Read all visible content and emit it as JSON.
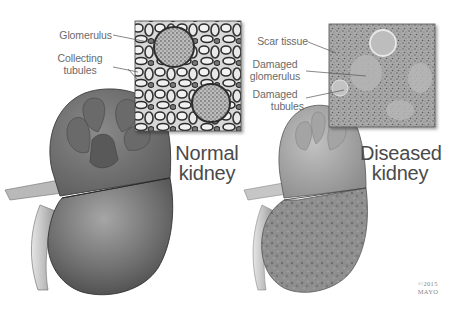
{
  "figure": {
    "normal": {
      "title_line1": "Normal",
      "title_line2": "kidney",
      "labels": {
        "glomerulus": "Glomerulus",
        "collecting_tubules_line1": "Collecting",
        "collecting_tubules_line2": "tubules"
      }
    },
    "diseased": {
      "title_line1": "Diseased",
      "title_line2": "kidney",
      "labels": {
        "scar_tissue": "Scar tissue",
        "damaged_glomerulus_line1": "Damaged",
        "damaged_glomerulus_line2": "glomerulus",
        "damaged_tubules_line1": "Damaged",
        "damaged_tubules_line2": "tubules"
      }
    },
    "copyright": {
      "line1": "©2015",
      "line2": "MAYO"
    },
    "colors": {
      "background": "#ffffff",
      "label_text": "#6a6a6a",
      "title_text": "#4a4a4a",
      "normal_kidney_fill": "#6e6e6e",
      "diseased_kidney_fill": "#8e8e8e"
    }
  }
}
